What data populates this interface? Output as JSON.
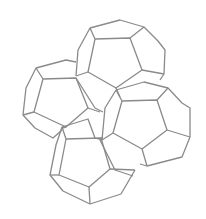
{
  "diagram": {
    "title": "",
    "stroke": "#8a8a8a",
    "background": "#ffffff",
    "shapes": [
      {
        "name": "dodecahedron-top",
        "lines": [
          [
            [
              90,
              28
            ],
            [
              120,
              20
            ],
            [
              144,
              27
            ],
            [
              158,
              41
            ],
            [
              165,
              50
            ],
            [
              164,
              74
            ],
            [
              160,
              80
            ]
          ],
          [
            [
              90,
              28
            ],
            [
              78,
              50
            ],
            [
              76,
              76
            ]
          ],
          [
            [
              90,
              28
            ],
            [
              95,
              39
            ],
            [
              130,
              38
            ],
            [
              142,
              70
            ],
            [
              116,
              88
            ],
            [
              88,
              72
            ],
            [
              95,
              39
            ]
          ],
          [
            [
              130,
              38
            ],
            [
              144,
              27
            ]
          ],
          [
            [
              142,
              70
            ],
            [
              164,
              74
            ]
          ],
          [
            [
              88,
              72
            ],
            [
              76,
              76
            ]
          ],
          [
            [
              116,
              88
            ],
            [
              120,
              97
            ]
          ]
        ]
      },
      {
        "name": "dodecahedron-left",
        "lines": [
          [
            [
              36,
              68
            ],
            [
              66,
              60
            ],
            [
              76,
              62
            ]
          ],
          [
            [
              36,
              68
            ],
            [
              26,
              88
            ],
            [
              23,
              115
            ],
            [
              35,
              128
            ],
            [
              53,
              138
            ],
            [
              62,
              130
            ]
          ],
          [
            [
              36,
              68
            ],
            [
              43,
              79
            ],
            [
              76,
              78
            ],
            [
              88,
              108
            ],
            [
              66,
              127
            ],
            [
              34,
              112
            ],
            [
              43,
              79
            ]
          ],
          [
            [
              34,
              112
            ],
            [
              23,
              115
            ]
          ],
          [
            [
              88,
              108
            ],
            [
              100,
              112
            ]
          ],
          [
            [
              66,
              127
            ],
            [
              62,
              128
            ]
          ]
        ]
      },
      {
        "name": "dodecahedron-right",
        "lines": [
          [
            [
              116,
              90
            ],
            [
              144,
              82
            ],
            [
              168,
              88
            ],
            [
              182,
              103
            ],
            [
              190,
              108
            ],
            [
              190,
              137
            ],
            [
              182,
              157
            ],
            [
              147,
              166
            ],
            [
              140,
              164
            ]
          ],
          [
            [
              116,
              90
            ],
            [
              105,
              108
            ],
            [
              102,
              140
            ]
          ],
          [
            [
              116,
              90
            ],
            [
              122,
              101
            ],
            [
              157,
              100
            ],
            [
              167,
              130
            ],
            [
              142,
              149
            ],
            [
              113,
              133
            ],
            [
              122,
              101
            ]
          ],
          [
            [
              157,
              100
            ],
            [
              168,
              88
            ]
          ],
          [
            [
              167,
              130
            ],
            [
              190,
              137
            ]
          ],
          [
            [
              142,
              149
            ],
            [
              147,
              166
            ]
          ],
          [
            [
              113,
              133
            ],
            [
              102,
              140
            ]
          ]
        ]
      },
      {
        "name": "dodecahedron-bottom",
        "lines": [
          [
            [
              62,
              127
            ],
            [
              88,
              119
            ],
            [
              95,
              138
            ]
          ],
          [
            [
              62,
              127
            ],
            [
              56,
              145
            ],
            [
              50,
              175
            ],
            [
              63,
              191
            ],
            [
              90,
              204
            ],
            [
              121,
              194
            ],
            [
              135,
              170
            ]
          ],
          [
            [
              62,
              127
            ],
            [
              66,
              139
            ],
            [
              101,
              138
            ],
            [
              110,
              169
            ],
            [
              89,
              187
            ],
            [
              59,
              175
            ],
            [
              66,
              139
            ]
          ],
          [
            [
              101,
              138
            ],
            [
              103,
              137
            ]
          ],
          [
            [
              110,
              169
            ],
            [
              135,
              170
            ]
          ],
          [
            [
              89,
              187
            ],
            [
              90,
              204
            ]
          ],
          [
            [
              59,
              175
            ],
            [
              50,
              175
            ]
          ]
        ]
      },
      {
        "name": "connecting-edges",
        "lines": [
          [
            [
              76,
              78
            ],
            [
              95,
              108
            ],
            [
              103,
              112
            ]
          ],
          [
            [
              100,
              140
            ],
            [
              115,
              170
            ],
            [
              133,
              176
            ]
          ],
          [
            [
              95,
              138
            ],
            [
              102,
              140
            ]
          ]
        ]
      }
    ]
  }
}
